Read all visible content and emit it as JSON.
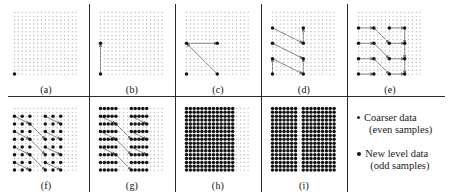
{
  "figure": {
    "grid": {
      "cols": 17,
      "rows": 17,
      "step": 3.85,
      "origin_x": 4.5,
      "origin_y": 4.5
    },
    "dot_light_color": "#b8b8b8",
    "dot_dark_color": "#141414",
    "arrow_color": "#6e6e6e",
    "divider_color": "#2b2b2b",
    "background_color": "#ffffff"
  },
  "panels": [
    {
      "id": "a",
      "caption": "(a)",
      "x": 10,
      "y": 8,
      "w": 72,
      "h": 76,
      "dark_dots": [
        [
          0,
          16
        ]
      ],
      "arrows": []
    },
    {
      "id": "b",
      "caption": "(b)",
      "x": 96,
      "y": 8,
      "w": 72,
      "h": 76,
      "dark_dots": [
        [
          0,
          16
        ],
        [
          0,
          8
        ]
      ],
      "arrows": [
        [
          0,
          16,
          0,
          8
        ]
      ]
    },
    {
      "id": "c",
      "caption": "(c)",
      "x": 182,
      "y": 8,
      "w": 72,
      "h": 76,
      "dark_dots": [
        [
          0,
          16
        ],
        [
          8,
          16
        ],
        [
          0,
          8
        ],
        [
          8,
          8
        ]
      ],
      "arrows": [
        [
          0,
          8,
          8,
          8
        ],
        [
          8,
          16,
          0,
          8
        ]
      ]
    },
    {
      "id": "d",
      "caption": "(d)",
      "x": 268,
      "y": 8,
      "w": 72,
      "h": 76,
      "dark_dots": [
        [
          0,
          16
        ],
        [
          8,
          16
        ],
        [
          0,
          12
        ],
        [
          8,
          12
        ],
        [
          0,
          8
        ],
        [
          8,
          8
        ],
        [
          0,
          4
        ],
        [
          8,
          4
        ]
      ],
      "arrows": [
        [
          0,
          4,
          8,
          8
        ],
        [
          8,
          8,
          8,
          4
        ],
        [
          0,
          8,
          8,
          12
        ],
        [
          0,
          12,
          8,
          16
        ],
        [
          8,
          16,
          8,
          12
        ],
        [
          0,
          16,
          0,
          12
        ]
      ]
    },
    {
      "id": "e",
      "caption": "(e)",
      "x": 354,
      "y": 8,
      "w": 72,
      "h": 76,
      "dark_dots": [
        [
          0,
          16
        ],
        [
          4,
          16
        ],
        [
          8,
          16
        ],
        [
          12,
          16
        ],
        [
          0,
          12
        ],
        [
          4,
          12
        ],
        [
          8,
          12
        ],
        [
          12,
          12
        ],
        [
          0,
          8
        ],
        [
          4,
          8
        ],
        [
          8,
          8
        ],
        [
          12,
          8
        ],
        [
          0,
          4
        ],
        [
          4,
          4
        ],
        [
          8,
          4
        ],
        [
          12,
          4
        ]
      ],
      "arrows": [
        [
          0,
          4,
          4,
          4
        ],
        [
          8,
          4,
          12,
          4
        ],
        [
          0,
          8,
          4,
          8
        ],
        [
          8,
          8,
          12,
          8
        ],
        [
          0,
          12,
          4,
          12
        ],
        [
          8,
          12,
          12,
          12
        ],
        [
          0,
          16,
          4,
          16
        ],
        [
          8,
          16,
          12,
          16
        ],
        [
          4,
          4,
          8,
          8
        ],
        [
          12,
          4,
          12,
          8
        ],
        [
          4,
          8,
          8,
          12
        ],
        [
          12,
          8,
          12,
          12
        ],
        [
          4,
          12,
          8,
          16
        ],
        [
          12,
          12,
          12,
          16
        ]
      ]
    },
    {
      "id": "f",
      "caption": "(f)",
      "x": 10,
      "y": 104,
      "w": 72,
      "h": 76,
      "dark_dots": [
        [
          0,
          16
        ],
        [
          2,
          16
        ],
        [
          4,
          16
        ],
        [
          8,
          16
        ],
        [
          10,
          16
        ],
        [
          12,
          16
        ],
        [
          0,
          14
        ],
        [
          2,
          14
        ],
        [
          4,
          14
        ],
        [
          8,
          14
        ],
        [
          10,
          14
        ],
        [
          12,
          14
        ],
        [
          0,
          12
        ],
        [
          2,
          12
        ],
        [
          4,
          12
        ],
        [
          8,
          12
        ],
        [
          10,
          12
        ],
        [
          12,
          12
        ],
        [
          0,
          10
        ],
        [
          2,
          10
        ],
        [
          4,
          10
        ],
        [
          8,
          10
        ],
        [
          10,
          10
        ],
        [
          12,
          10
        ],
        [
          0,
          8
        ],
        [
          2,
          8
        ],
        [
          4,
          8
        ],
        [
          8,
          8
        ],
        [
          10,
          8
        ],
        [
          12,
          8
        ],
        [
          0,
          6
        ],
        [
          2,
          6
        ],
        [
          4,
          6
        ],
        [
          8,
          6
        ],
        [
          10,
          6
        ],
        [
          12,
          6
        ],
        [
          0,
          4
        ],
        [
          2,
          4
        ],
        [
          4,
          4
        ],
        [
          8,
          4
        ],
        [
          10,
          4
        ],
        [
          12,
          4
        ],
        [
          0,
          2
        ],
        [
          2,
          2
        ],
        [
          4,
          2
        ],
        [
          8,
          2
        ],
        [
          10,
          2
        ],
        [
          12,
          2
        ]
      ],
      "arrows": [
        [
          0,
          2,
          4,
          4
        ],
        [
          8,
          2,
          12,
          4
        ],
        [
          0,
          6,
          4,
          8
        ],
        [
          8,
          6,
          12,
          8
        ],
        [
          0,
          10,
          4,
          12
        ],
        [
          8,
          10,
          12,
          12
        ],
        [
          0,
          14,
          4,
          16
        ],
        [
          8,
          14,
          12,
          16
        ],
        [
          4,
          4,
          8,
          8
        ],
        [
          4,
          8,
          8,
          12
        ],
        [
          4,
          12,
          8,
          16
        ]
      ]
    },
    {
      "id": "g",
      "caption": "(g)",
      "x": 96,
      "y": 104,
      "w": 72,
      "h": 76,
      "dark_dots": [
        [
          0,
          16
        ],
        [
          1,
          16
        ],
        [
          2,
          16
        ],
        [
          3,
          16
        ],
        [
          4,
          16
        ],
        [
          8,
          16
        ],
        [
          9,
          16
        ],
        [
          10,
          16
        ],
        [
          11,
          16
        ],
        [
          12,
          16
        ],
        [
          0,
          14
        ],
        [
          1,
          14
        ],
        [
          2,
          14
        ],
        [
          3,
          14
        ],
        [
          4,
          14
        ],
        [
          8,
          14
        ],
        [
          9,
          14
        ],
        [
          10,
          14
        ],
        [
          11,
          14
        ],
        [
          12,
          14
        ],
        [
          0,
          12
        ],
        [
          1,
          12
        ],
        [
          2,
          12
        ],
        [
          3,
          12
        ],
        [
          4,
          12
        ],
        [
          8,
          12
        ],
        [
          9,
          12
        ],
        [
          10,
          12
        ],
        [
          11,
          12
        ],
        [
          12,
          12
        ],
        [
          0,
          10
        ],
        [
          1,
          10
        ],
        [
          2,
          10
        ],
        [
          3,
          10
        ],
        [
          4,
          10
        ],
        [
          8,
          10
        ],
        [
          9,
          10
        ],
        [
          10,
          10
        ],
        [
          11,
          10
        ],
        [
          12,
          10
        ],
        [
          0,
          8
        ],
        [
          1,
          8
        ],
        [
          2,
          8
        ],
        [
          3,
          8
        ],
        [
          4,
          8
        ],
        [
          8,
          8
        ],
        [
          9,
          8
        ],
        [
          10,
          8
        ],
        [
          11,
          8
        ],
        [
          12,
          8
        ],
        [
          0,
          6
        ],
        [
          1,
          6
        ],
        [
          2,
          6
        ],
        [
          3,
          6
        ],
        [
          4,
          6
        ],
        [
          8,
          6
        ],
        [
          9,
          6
        ],
        [
          10,
          6
        ],
        [
          11,
          6
        ],
        [
          12,
          6
        ],
        [
          0,
          4
        ],
        [
          1,
          4
        ],
        [
          2,
          4
        ],
        [
          3,
          4
        ],
        [
          4,
          4
        ],
        [
          8,
          4
        ],
        [
          9,
          4
        ],
        [
          10,
          4
        ],
        [
          11,
          4
        ],
        [
          12,
          4
        ],
        [
          0,
          2
        ],
        [
          1,
          2
        ],
        [
          2,
          2
        ],
        [
          3,
          2
        ],
        [
          4,
          2
        ],
        [
          8,
          2
        ],
        [
          9,
          2
        ],
        [
          10,
          2
        ],
        [
          11,
          2
        ],
        [
          12,
          2
        ],
        [
          0,
          0
        ],
        [
          1,
          0
        ],
        [
          2,
          0
        ],
        [
          3,
          0
        ],
        [
          4,
          0
        ],
        [
          8,
          0
        ],
        [
          9,
          0
        ],
        [
          10,
          0
        ],
        [
          11,
          0
        ],
        [
          12,
          0
        ]
      ],
      "arrows": [
        [
          0,
          2,
          4,
          4
        ],
        [
          8,
          2,
          12,
          4
        ],
        [
          0,
          6,
          4,
          8
        ],
        [
          8,
          6,
          12,
          8
        ],
        [
          0,
          10,
          4,
          12
        ],
        [
          8,
          10,
          12,
          12
        ],
        [
          4,
          4,
          8,
          8
        ],
        [
          4,
          8,
          8,
          12
        ],
        [
          4,
          12,
          8,
          16
        ]
      ]
    },
    {
      "id": "h",
      "caption": "(h)",
      "x": 182,
      "y": 104,
      "w": 72,
      "h": 76,
      "dark_dots": [],
      "dark_rule": "cols_0_to_12_all_rows",
      "arrows": []
    },
    {
      "id": "i",
      "caption": "(i)",
      "x": 268,
      "y": 104,
      "w": 72,
      "h": 76,
      "dark_dots": [],
      "dark_rule": "all_except_col_7",
      "arrows": []
    }
  ],
  "dividers": {
    "vertical_x": [
      88.5,
      174.5,
      260.5,
      346.5
    ],
    "vertical_y": 4,
    "vertical_h": 188,
    "horizontal_y": 96,
    "horizontal_x": 8,
    "horizontal_w": 437
  },
  "legend": {
    "items": [
      {
        "label": "Coarser data",
        "sublabel": "(even samples)",
        "bullet_size": 3.0
      },
      {
        "label": "New level data",
        "sublabel": "(odd samples)",
        "bullet_size": 4.2
      }
    ]
  }
}
